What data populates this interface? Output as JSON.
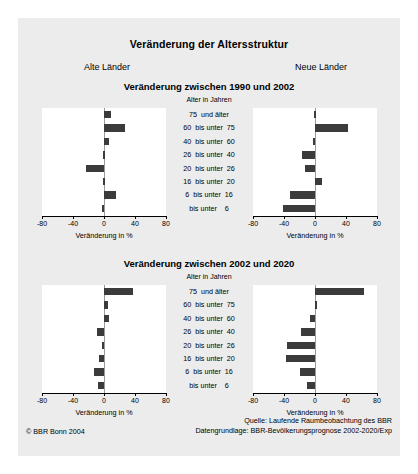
{
  "figure": {
    "title": "Veränderung der Altersstruktur",
    "region_left": "Alte Länder",
    "region_right": "Neue Länder",
    "age_axis_head": "Alter in Jahren",
    "value_axis_title": "Veränderung in %",
    "copyright": "© BBR Bonn 2004",
    "source_line1": "Quelle: Laufende Raumbeobachtung des BBR",
    "source_line2": "Datengrundlage: BBR-Bevölkerungsprognose 2002-2020/Exp",
    "background": "#ececec",
    "bar_color": "#3b3b3b",
    "panels": [
      {
        "title": "Veränderung zwischen 1990 und 2002"
      },
      {
        "title": "Veränderung zwischen 2002 und 2020"
      }
    ]
  },
  "chart_data": [
    {
      "type": "bar",
      "orientation": "horizontal",
      "title": "Veränderung zwischen 1990 und 2002",
      "subtitle": "Alte Länder",
      "panel": 0,
      "side": "left",
      "xlabel": "Veränderung in %",
      "ylabel": "Alter in Jahren",
      "xlim": [
        -80,
        80
      ],
      "xticks": [
        -80,
        -40,
        0,
        40,
        80
      ],
      "xticklabels": [
        "-80",
        "-40",
        "0",
        "40",
        "80"
      ],
      "grid": false,
      "legend": null,
      "categories": [
        "75  und älter",
        "60  bis unter  75",
        "40  bis unter  60",
        "26  bis unter  40",
        "20  bis unter  26",
        "16  bis unter  20",
        "6  bis unter  16",
        "bis unter    6"
      ],
      "values": [
        9,
        27,
        6,
        -1,
        -23,
        -1,
        16,
        -3
      ]
    },
    {
      "type": "bar",
      "orientation": "horizontal",
      "title": "Veränderung zwischen 1990 und 2002",
      "subtitle": "Neue Länder",
      "panel": 0,
      "side": "right",
      "xlabel": "Veränderung in %",
      "ylabel": "Alter in Jahren",
      "xlim": [
        -80,
        80
      ],
      "xticks": [
        -80,
        -40,
        0,
        40,
        80
      ],
      "xticklabels": [
        "-80",
        "-40",
        "0",
        "40",
        "80"
      ],
      "grid": false,
      "legend": null,
      "categories": [
        "75  und älter",
        "60  bis unter  75",
        "40  bis unter  60",
        "26  bis unter  40",
        "20  bis unter  26",
        "16  bis unter  20",
        "6  bis unter  16",
        "bis unter    6"
      ],
      "values": [
        -1,
        42,
        -2,
        -17,
        -13,
        9,
        -32,
        -41
      ]
    },
    {
      "type": "bar",
      "orientation": "horizontal",
      "title": "Veränderung zwischen 2002 und 2020",
      "subtitle": "Alte Länder",
      "panel": 1,
      "side": "left",
      "xlabel": "Veränderung in %",
      "ylabel": "Alter in Jahren",
      "xlim": [
        -80,
        80
      ],
      "xticks": [
        -80,
        -40,
        0,
        40,
        80
      ],
      "xticklabels": [
        "-80",
        "-40",
        "0",
        "40",
        "80"
      ],
      "grid": false,
      "legend": null,
      "categories": [
        "75  und älter",
        "60  bis unter  75",
        "40  bis unter  60",
        "26  bis unter  40",
        "20  bis unter  26",
        "16  bis unter  20",
        "6  bis unter  16",
        "bis unter    6"
      ],
      "values": [
        37,
        5,
        6,
        -9,
        -2,
        -6,
        -13,
        -8
      ]
    },
    {
      "type": "bar",
      "orientation": "horizontal",
      "title": "Veränderung zwischen 2002 und 2020",
      "subtitle": "Neue Länder",
      "panel": 1,
      "side": "right",
      "xlabel": "Veränderung in %",
      "ylabel": "Alter in Jahren",
      "xlim": [
        -80,
        80
      ],
      "xticks": [
        -80,
        -40,
        0,
        40,
        80
      ],
      "xticklabels": [
        "-80",
        "-40",
        "0",
        "40",
        "80"
      ],
      "grid": false,
      "legend": null,
      "categories": [
        "75  und älter",
        "60  bis unter  75",
        "40  bis unter  60",
        "26  bis unter  40",
        "20  bis unter  26",
        "16  bis unter  20",
        "6  bis unter  16",
        "bis unter    6"
      ],
      "values": [
        63,
        3,
        -6,
        -18,
        -36,
        -38,
        -20,
        -10
      ]
    }
  ]
}
